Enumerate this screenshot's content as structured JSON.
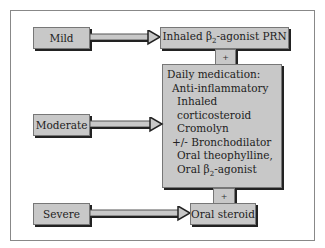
{
  "diagram": {
    "severity_levels": [
      {
        "label": "Mild"
      },
      {
        "label": "Moderate"
      },
      {
        "label": "Severe"
      }
    ],
    "inhaled_box": {
      "prefix": "Inhaled β",
      "sub": "2",
      "suffix": "-agonist PRN"
    },
    "plus_top": "+",
    "plus_bottom": "+",
    "daily": {
      "title": "Daily medication:",
      "anti": "Anti-inflammatory",
      "anti_items": [
        "Inhaled corticosteroid",
        "Cromolyn"
      ],
      "broncho": "+/- Bronchodilator",
      "broncho_items": [
        "Oral theophylline,"
      ],
      "oral_beta": {
        "prefix": "Oral β",
        "sub": "2",
        "suffix": "-agonist"
      }
    },
    "oral_steroid": "Oral steroid"
  }
}
